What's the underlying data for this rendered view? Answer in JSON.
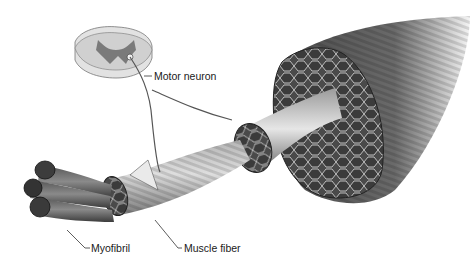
{
  "diagram": {
    "labels": {
      "motor_neuron": "Motor neuron",
      "myofibril": "Myofibril",
      "muscle_fiber": "Muscle fiber"
    },
    "colors": {
      "background": "#ffffff",
      "dark_tissue": "#3a3a3a",
      "mid_tissue": "#7a7a7a",
      "light_tissue": "#cfcfcf",
      "leader_line": "#333333"
    }
  }
}
